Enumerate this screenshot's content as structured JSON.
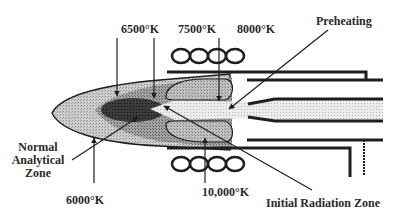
{
  "diagram": {
    "type": "ICP torch plasma temperature zones",
    "labels": {
      "t6500": "6500°K",
      "t7500": "7500°K",
      "t8000": "8000°K",
      "preheating": "Preheating",
      "normal_line1": "Normal",
      "normal_line2": "Analytical",
      "normal_line3": "Zone",
      "t6000": "6000°K",
      "t10000": "10,000°K",
      "initial_radiation": "Initial Radiation Zone"
    },
    "colors": {
      "ink": "#1e1e1e",
      "outer_plume": "#c9c9c9",
      "mid_plume": "#9a9a9a",
      "core": "#3a3a3a",
      "toroid": "#bdbdbd",
      "channel": "#e6e6e6",
      "background": "#ffffff"
    },
    "elements": [
      "load-coil-top",
      "load-coil-bottom",
      "outer-tube",
      "intermediate-tube",
      "injector-tube",
      "plasma-plume",
      "analytical-core",
      "toroidal-zones",
      "central-channel"
    ]
  }
}
